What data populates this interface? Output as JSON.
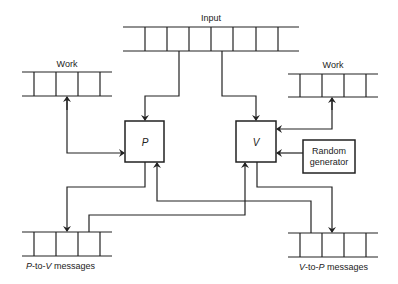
{
  "diagram": {
    "queues": {
      "input": {
        "label": "Input",
        "cells": 8
      },
      "work_p": {
        "label": "Work",
        "cells": 5
      },
      "work_v": {
        "label": "Work",
        "cells": 5
      },
      "p_to_v": {
        "label_p1": "P",
        "label_mid": "-to-",
        "label_p2": "V",
        "label_rest": " messages",
        "cells": 5
      },
      "v_to_p": {
        "label_p1": "V",
        "label_mid": "-to-",
        "label_p2": "P",
        "label_rest": " messages",
        "cells": 5
      }
    },
    "nodes": {
      "prover": {
        "label": "P"
      },
      "verifier": {
        "label": "V"
      },
      "random_generator": {
        "line1": "Random",
        "line2": "generator"
      }
    },
    "edges": [
      {
        "from": "input",
        "to": "prover"
      },
      {
        "from": "input",
        "to": "verifier"
      },
      {
        "from": "work_p",
        "to": "prover",
        "bidirectional": true
      },
      {
        "from": "work_v",
        "to": "verifier",
        "bidirectional": true
      },
      {
        "from": "random_generator",
        "to": "verifier"
      },
      {
        "from": "prover",
        "to": "p_to_v"
      },
      {
        "from": "p_to_v",
        "to": "verifier"
      },
      {
        "from": "verifier",
        "to": "v_to_p"
      },
      {
        "from": "v_to_p",
        "to": "prover"
      }
    ],
    "colors": {
      "stroke": "#222222",
      "background": "#ffffff"
    }
  }
}
